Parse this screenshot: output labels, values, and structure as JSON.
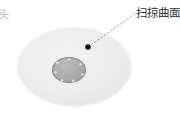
{
  "figure": {
    "type": "technical-illustration",
    "width": 180,
    "height": 114,
    "background_color": "#ffffff",
    "callout": {
      "label": "扫掠曲面",
      "label_color": "#2b2b2b",
      "marker": {
        "name": "point-marker",
        "color": "#111111",
        "cx": 88,
        "cy": 47,
        "r": 2.8
      },
      "leader_line": {
        "style": "dashed",
        "color": "#9a9a9a",
        "x1": 88,
        "y1": 47,
        "x2": 136,
        "y2": 13
      }
    },
    "edge_label": {
      "label": "头",
      "label_color": "#b9b9b9",
      "clipped": true
    },
    "outer_surface": {
      "name": "swept-surface-body",
      "shape": "ellipse",
      "cx": 74.5,
      "cy": 67,
      "rx": 56.5,
      "ry": 39,
      "fill_color": "#ededed",
      "edge_color": "#e2e2e2"
    },
    "inner_disc": {
      "name": "recessed-disc",
      "shape": "ellipse",
      "cx": 69,
      "cy": 70,
      "rx": 16.5,
      "ry": 12.5,
      "fill_color": "#a9a9a9",
      "stroke_color": "#8a8a8a",
      "highlight_color": "#d8d8d8",
      "bolt_dots": [
        {
          "cx": 69.0,
          "cy": 59.6
        },
        {
          "cx": 80.7,
          "cy": 64.3
        },
        {
          "cx": 82.4,
          "cy": 74.6
        },
        {
          "cx": 73.3,
          "cy": 80.8
        },
        {
          "cx": 62.0,
          "cy": 80.2
        },
        {
          "cx": 55.6,
          "cy": 72.5
        },
        {
          "cx": 57.4,
          "cy": 62.8
        }
      ],
      "bolt_dot_color": "#e4e4e4"
    }
  }
}
